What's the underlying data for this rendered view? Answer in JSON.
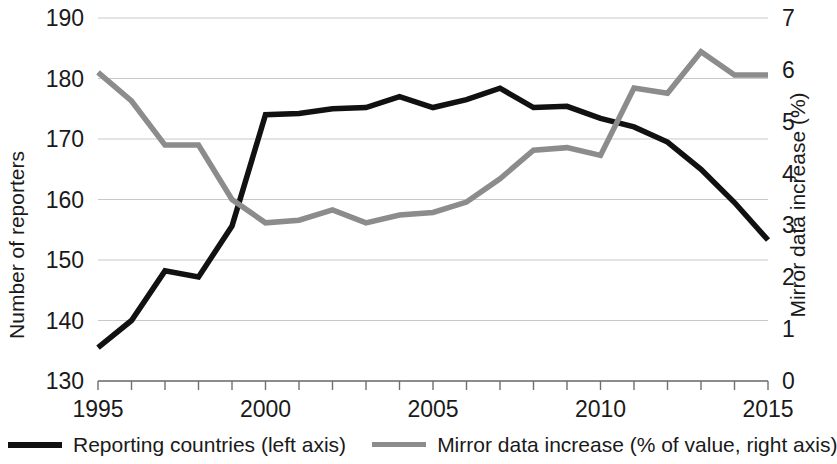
{
  "chart_data": {
    "type": "line",
    "title": "",
    "xlabel": "",
    "x": [
      1995,
      1996,
      1997,
      1998,
      1999,
      2000,
      2001,
      2002,
      2003,
      2004,
      2005,
      2006,
      2007,
      2008,
      2009,
      2010,
      2011,
      2012,
      2013,
      2014,
      2015
    ],
    "xlim": [
      1995,
      2015
    ],
    "xticks": [
      1995,
      1996,
      1997,
      1998,
      1999,
      2000,
      2001,
      2002,
      2003,
      2004,
      2005,
      2006,
      2007,
      2008,
      2009,
      2010,
      2011,
      2012,
      2013,
      2014,
      2015
    ],
    "xtick_labels_shown": [
      "1995",
      "2000",
      "2005",
      "2010",
      "2015"
    ],
    "grid": true,
    "legend_position": "bottom",
    "left_axis": {
      "label": "Number of reporters",
      "ylim": [
        130,
        190
      ],
      "ticks": [
        130,
        140,
        150,
        160,
        170,
        180,
        190
      ],
      "tick_labels": [
        "130",
        "140",
        "150",
        "160",
        "170",
        "180",
        "190"
      ]
    },
    "right_axis": {
      "label": "Mirror data increase (%)",
      "ylim": [
        0,
        7
      ],
      "ticks": [
        0,
        1,
        2,
        3,
        4,
        5,
        6,
        7
      ],
      "tick_labels": [
        "0",
        "1",
        "2",
        "3",
        "4",
        "5",
        "6",
        "7"
      ]
    },
    "series": [
      {
        "name": "Reporting countries (left axis)",
        "axis": "left",
        "color": "#111111",
        "stroke_width": 5.5,
        "values": [
          135.5,
          140.0,
          148.2,
          147.2,
          155.6,
          174.0,
          174.2,
          175.0,
          175.2,
          177.0,
          175.2,
          176.5,
          178.4,
          175.2,
          175.4,
          173.4,
          172.0,
          169.5,
          165.0,
          159.5,
          153.3
        ]
      },
      {
        "name": "Mirror data increase (% of value, right axis)",
        "axis": "right",
        "color": "#8c8c8c",
        "stroke_width": 5.5,
        "values": [
          5.95,
          5.4,
          4.55,
          4.55,
          3.5,
          3.05,
          3.1,
          3.3,
          3.05,
          3.2,
          3.25,
          3.45,
          3.9,
          4.45,
          4.5,
          4.35,
          5.65,
          5.55,
          6.35,
          5.9,
          5.9
        ]
      }
    ]
  },
  "legend": {
    "entries": [
      {
        "label": "Reporting countries (left axis)",
        "color": "#111111"
      },
      {
        "label": "Mirror data increase (% of value, right axis)",
        "color": "#8c8c8c"
      }
    ]
  }
}
